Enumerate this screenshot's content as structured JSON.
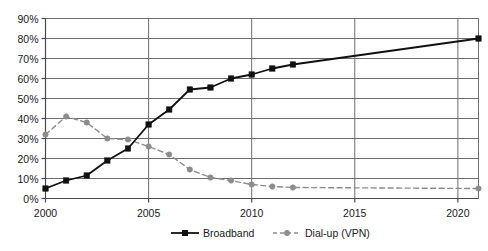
{
  "chart_data": {
    "type": "line",
    "title": "",
    "subtitle": "",
    "xlabel": "",
    "ylabel": "",
    "xlim": [
      2000,
      2021
    ],
    "ylim": [
      0,
      90
    ],
    "grid": true,
    "grid_axis": "both",
    "legend_position": "bottom",
    "y_tick_labels": [
      "0%",
      "10%",
      "20%",
      "30%",
      "40%",
      "50%",
      "60%",
      "70%",
      "80%",
      "90%"
    ],
    "y_tick_values": [
      0,
      10,
      20,
      30,
      40,
      50,
      60,
      70,
      80,
      90
    ],
    "x_tick_labels": [
      "2000",
      "2005",
      "2010",
      "2015",
      "2020"
    ],
    "x_tick_values": [
      2000,
      2005,
      2010,
      2015,
      2020
    ],
    "series": [
      {
        "name": "Broadband",
        "color": "#111111",
        "line_style": "solid",
        "marker": "square",
        "x": [
          2000,
          2001,
          2002,
          2003,
          2004,
          2005,
          2006,
          2007,
          2008,
          2009,
          2010,
          2011,
          2012,
          2021
        ],
        "values": [
          5,
          9,
          11.5,
          19,
          25,
          37,
          44.5,
          54.5,
          55.5,
          60,
          62,
          65,
          67,
          80
        ]
      },
      {
        "name": "Dial-up (VPN)",
        "color": "#8c8c8c",
        "line_style": "dashed",
        "marker": "circle",
        "x": [
          2000,
          2001,
          2002,
          2003,
          2004,
          2005,
          2006,
          2007,
          2008,
          2009,
          2010,
          2011,
          2012,
          2021
        ],
        "values": [
          32,
          41,
          38,
          30,
          29.5,
          26,
          22,
          14.5,
          10.5,
          9,
          7,
          6,
          5.5,
          5
        ]
      }
    ]
  },
  "legend": {
    "items": [
      {
        "label": "Broadband"
      },
      {
        "label": "Dial-up (VPN)"
      }
    ]
  },
  "colors": {
    "broadband": "#111111",
    "dialup": "#8c8c8c",
    "grid": "#6e6e6e",
    "axis": "#4a4a4a",
    "text": "#1a1a1a",
    "background": "#ffffff"
  }
}
